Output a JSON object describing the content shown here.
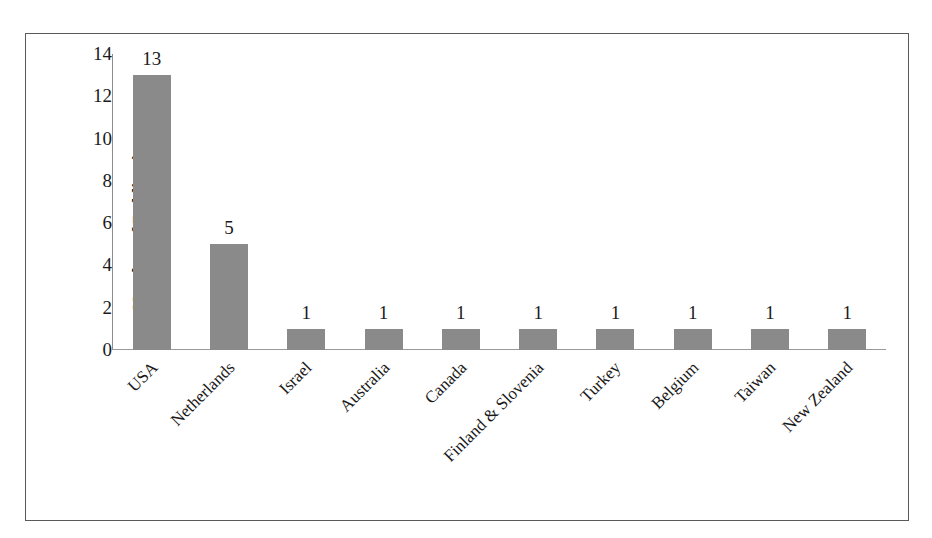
{
  "chart_data": {
    "type": "bar",
    "title": "",
    "xlabel": "",
    "ylabel": "Number of Publications",
    "categories": [
      "USA",
      "Netherlands",
      "Israel",
      "Australia",
      "Canada",
      "Finland & Slovenia",
      "Turkey",
      "Belgium",
      "Taiwan",
      "New Zealand"
    ],
    "values": [
      13,
      5,
      1,
      1,
      1,
      1,
      1,
      1,
      1,
      1
    ],
    "value_labels": [
      "13",
      "5",
      "1",
      "1",
      "1",
      "1",
      "1",
      "1",
      "1",
      "1"
    ],
    "ylim": [
      0,
      14
    ],
    "yticks": [
      14,
      12,
      10,
      8,
      6,
      4,
      2,
      0
    ],
    "ytick_labels": [
      "14",
      "12",
      "10",
      "8",
      "6",
      "4",
      "2",
      "0"
    ],
    "grid": false,
    "legend": null,
    "legend_position": "none",
    "bar_color": "#8a8a8a",
    "axis_color": "#8c8c8c",
    "text_color": "#1a1a1a",
    "frame_color": "#5a5a5a",
    "background_color": "#ffffff",
    "xtick_rotation_degrees": 45
  }
}
